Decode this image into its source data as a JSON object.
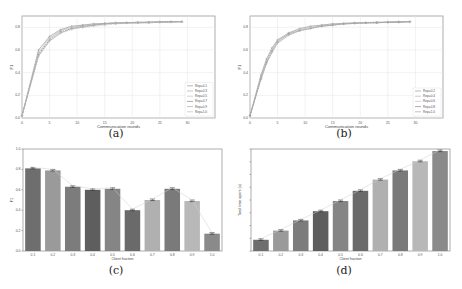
{
  "chart_data": [
    {
      "id": "a",
      "type": "line",
      "caption": "(a)",
      "title": "",
      "xlabel": "Communication rounds",
      "ylabel": "F1",
      "xlim": [
        0,
        35
      ],
      "ylim": [
        0,
        0.9
      ],
      "xticks": [
        "0",
        "5",
        "10",
        "15",
        "20",
        "25",
        "30"
      ],
      "yticks": [
        "0.0",
        "0.2",
        "0.4",
        "0.6",
        "0.8"
      ],
      "grid": true,
      "legend_position": "lower right",
      "series": [
        {
          "name": "Rep=0.1",
          "x": [
            0,
            3,
            5,
            7,
            9,
            11,
            13,
            15,
            17,
            19,
            21,
            23,
            25,
            27,
            29
          ],
          "values": [
            0.02,
            0.6,
            0.72,
            0.78,
            0.81,
            0.82,
            0.83,
            0.835,
            0.84,
            0.84,
            0.845,
            0.845,
            0.85,
            0.85,
            0.85
          ]
        },
        {
          "name": "Rep=0.3",
          "x": [
            0,
            3,
            5,
            7,
            9,
            11,
            13,
            15,
            17,
            19,
            21,
            23,
            25,
            27,
            29
          ],
          "values": [
            0.02,
            0.58,
            0.71,
            0.77,
            0.8,
            0.82,
            0.83,
            0.835,
            0.84,
            0.84,
            0.845,
            0.845,
            0.85,
            0.85,
            0.85
          ]
        },
        {
          "name": "Rep=0.5",
          "x": [
            0,
            3,
            5,
            7,
            9,
            11,
            13,
            15,
            17,
            19,
            21,
            23,
            25,
            27,
            29
          ],
          "values": [
            0.02,
            0.57,
            0.7,
            0.77,
            0.8,
            0.81,
            0.82,
            0.83,
            0.84,
            0.84,
            0.84,
            0.845,
            0.845,
            0.85,
            0.85
          ]
        },
        {
          "name": "Rep=0.7",
          "x": [
            0,
            3,
            5,
            7,
            9,
            11,
            13,
            15,
            17,
            19,
            21,
            23,
            25,
            27,
            29
          ],
          "values": [
            0.02,
            0.56,
            0.69,
            0.76,
            0.79,
            0.81,
            0.82,
            0.83,
            0.835,
            0.84,
            0.84,
            0.845,
            0.845,
            0.85,
            0.85
          ]
        },
        {
          "name": "Rep=0.9",
          "x": [
            0,
            3,
            5,
            7,
            9,
            11,
            13,
            15,
            17,
            19,
            21,
            23,
            25,
            27,
            29
          ],
          "values": [
            0.02,
            0.55,
            0.68,
            0.75,
            0.79,
            0.8,
            0.82,
            0.83,
            0.835,
            0.84,
            0.84,
            0.84,
            0.845,
            0.845,
            0.85
          ]
        },
        {
          "name": "Rep=1.0",
          "x": [
            0,
            3,
            5,
            7,
            9,
            11,
            13,
            15,
            17,
            19,
            21,
            23,
            25,
            27,
            29
          ],
          "values": [
            0.02,
            0.54,
            0.68,
            0.75,
            0.78,
            0.8,
            0.81,
            0.82,
            0.83,
            0.835,
            0.84,
            0.84,
            0.845,
            0.845,
            0.85
          ]
        }
      ]
    },
    {
      "id": "b",
      "type": "line",
      "caption": "(b)",
      "title": "",
      "xlabel": "Communication rounds",
      "ylabel": "F1",
      "xlim": [
        0,
        35
      ],
      "ylim": [
        0,
        0.9
      ],
      "xticks": [
        "0",
        "5",
        "10",
        "15",
        "20",
        "25",
        "30"
      ],
      "yticks": [
        "0.0",
        "0.2",
        "0.4",
        "0.6",
        "0.8"
      ],
      "grid": true,
      "legend_position": "lower right",
      "series": [
        {
          "name": "Rep=0.2",
          "x": [
            0,
            2,
            3,
            4,
            5,
            7,
            9,
            11,
            13,
            15,
            17,
            19,
            21,
            23,
            25,
            27,
            29
          ],
          "values": [
            0.02,
            0.38,
            0.52,
            0.62,
            0.69,
            0.75,
            0.79,
            0.81,
            0.82,
            0.83,
            0.835,
            0.84,
            0.84,
            0.845,
            0.845,
            0.85,
            0.85
          ]
        },
        {
          "name": "Rep=0.4",
          "x": [
            0,
            2,
            3,
            4,
            5,
            7,
            9,
            11,
            13,
            15,
            17,
            19,
            21,
            23,
            25,
            27,
            29
          ],
          "values": [
            0.02,
            0.37,
            0.51,
            0.61,
            0.68,
            0.75,
            0.78,
            0.8,
            0.82,
            0.83,
            0.835,
            0.84,
            0.84,
            0.845,
            0.845,
            0.85,
            0.85
          ]
        },
        {
          "name": "Rep=0.6",
          "x": [
            0,
            2,
            3,
            4,
            5,
            7,
            9,
            11,
            13,
            15,
            17,
            19,
            21,
            23,
            25,
            27,
            29
          ],
          "values": [
            0.02,
            0.36,
            0.5,
            0.6,
            0.68,
            0.74,
            0.78,
            0.8,
            0.81,
            0.82,
            0.83,
            0.835,
            0.84,
            0.84,
            0.845,
            0.845,
            0.85
          ]
        },
        {
          "name": "Rep=0.8",
          "x": [
            0,
            2,
            3,
            4,
            5,
            7,
            9,
            11,
            13,
            15,
            17,
            19,
            21,
            23,
            25,
            27,
            29
          ],
          "values": [
            0.02,
            0.35,
            0.49,
            0.59,
            0.67,
            0.74,
            0.77,
            0.79,
            0.81,
            0.82,
            0.83,
            0.835,
            0.84,
            0.84,
            0.845,
            0.845,
            0.85
          ]
        },
        {
          "name": "Rep=1.0",
          "x": [
            0,
            2,
            3,
            4,
            5,
            7,
            9,
            11,
            13,
            15,
            17,
            19,
            21,
            23,
            25,
            27,
            29
          ],
          "values": [
            0.02,
            0.34,
            0.48,
            0.58,
            0.66,
            0.73,
            0.77,
            0.79,
            0.81,
            0.82,
            0.83,
            0.835,
            0.84,
            0.84,
            0.845,
            0.845,
            0.85
          ]
        }
      ]
    },
    {
      "id": "c",
      "type": "bar",
      "caption": "(c)",
      "title": "",
      "xlabel": "Client fraction",
      "ylabel": "F1",
      "ylim": [
        0,
        1.0
      ],
      "yticks": [
        "0.0",
        "0.2",
        "0.4",
        "0.6",
        "0.8",
        "1.0"
      ],
      "categories": [
        "0.1",
        "0.2",
        "0.3",
        "0.4",
        "0.5",
        "0.6",
        "0.7",
        "0.8",
        "0.9",
        "1.0"
      ],
      "values": [
        0.81,
        0.79,
        0.63,
        0.6,
        0.61,
        0.4,
        0.5,
        0.61,
        0.49,
        0.17
      ],
      "error_bars": true,
      "trend_line": true,
      "colors": [
        "#6e6e6e",
        "#9a9a9a",
        "#7c7c7c",
        "#5e5e5e",
        "#858585",
        "#6a6a6a",
        "#b0b0b0",
        "#7a7a7a",
        "#b8b8b8",
        "#8a8a8a"
      ]
    },
    {
      "id": "d",
      "type": "bar",
      "caption": "(d)",
      "title": "",
      "xlabel": "Client fraction",
      "ylabel": "Total time spent (s)",
      "ylim": [
        0,
        1.0
      ],
      "yticks": [
        "",
        "",
        "",
        "",
        "",
        "",
        "",
        "",
        ""
      ],
      "categories": [
        "0.1",
        "0.2",
        "0.3",
        "0.4",
        "0.5",
        "0.6",
        "0.7",
        "0.8",
        "0.9",
        "1.0"
      ],
      "values": [
        0.11,
        0.2,
        0.3,
        0.39,
        0.49,
        0.59,
        0.7,
        0.79,
        0.88,
        0.98
      ],
      "error_bars": true,
      "trend_line": true,
      "colors": [
        "#6e6e6e",
        "#9a9a9a",
        "#7c7c7c",
        "#5e5e5e",
        "#858585",
        "#6a6a6a",
        "#b0b0b0",
        "#7a7a7a",
        "#b8b8b8",
        "#8a8a8a"
      ]
    }
  ]
}
